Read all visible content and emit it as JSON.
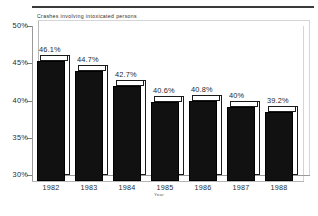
{
  "chart_data": {
    "type": "bar",
    "title": "Crashes involving intoxicated persons",
    "xlabel": "Year",
    "ylabel": "",
    "categories": [
      "1982",
      "1983",
      "1984",
      "1985",
      "1986",
      "1987",
      "1988"
    ],
    "values": [
      46.1,
      44.7,
      42.7,
      40.6,
      40.8,
      40.0,
      39.2
    ],
    "data_labels": [
      "46.1%",
      "44.7%",
      "42.7%",
      "40.6%",
      "40.8%",
      "40%",
      "39.2%"
    ],
    "ylim": [
      30,
      50
    ],
    "ytick_values": [
      50,
      45,
      40,
      35,
      30
    ],
    "ytick_labels": [
      "50%",
      "45%",
      "40%",
      "35%",
      "30%"
    ],
    "grid": false,
    "legend": false,
    "style": "3d-bar",
    "bar_color": "#111111",
    "bar_top_color": "#ffffff",
    "axis_color": "#9a9a9a"
  }
}
